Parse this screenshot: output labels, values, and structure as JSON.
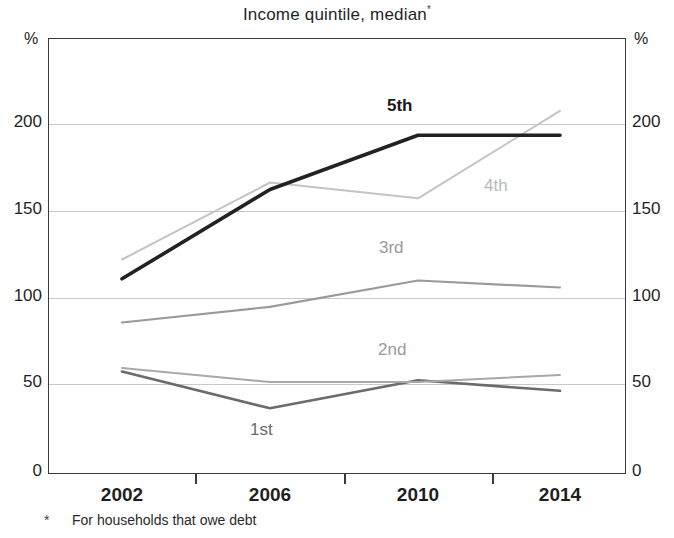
{
  "chart_data": {
    "type": "line",
    "title": "Income quintile, median",
    "title_superscript": "*",
    "xlabel": "",
    "ylabel": "%",
    "ylabel_right": "%",
    "x": [
      2002,
      2006,
      2010,
      2014
    ],
    "xtick_labels": [
      "2002",
      "2006",
      "2010",
      "2014"
    ],
    "ytick_labels": [
      "0",
      "50",
      "100",
      "150",
      "200"
    ],
    "yticks": [
      0,
      50,
      100,
      150,
      200
    ],
    "ylim": [
      0,
      230
    ],
    "grid": true,
    "legend_position": "inline-annotations",
    "footnote_marker": "*",
    "footnote": "For households that owe debt",
    "series": [
      {
        "name": "1st",
        "values": [
          58,
          37,
          53,
          47
        ],
        "color": "#6b6b6b"
      },
      {
        "name": "2nd",
        "values": [
          60,
          52,
          52,
          56
        ],
        "color": "#a8a8a8"
      },
      {
        "name": "3rd",
        "values": [
          86,
          95,
          110,
          106
        ],
        "color": "#9a9a9a"
      },
      {
        "name": "4th",
        "values": [
          122,
          166,
          157,
          207
        ],
        "color": "#c4c4c4"
      },
      {
        "name": "5th",
        "values": [
          111,
          162,
          193,
          193
        ],
        "color": "#222222"
      }
    ]
  },
  "annotations": [
    {
      "text": "5th",
      "series": "5th"
    },
    {
      "text": "4th",
      "series": "4th"
    },
    {
      "text": "3rd",
      "series": "3rd"
    },
    {
      "text": "2nd",
      "series": "2nd"
    },
    {
      "text": "1st",
      "series": "1st"
    }
  ]
}
